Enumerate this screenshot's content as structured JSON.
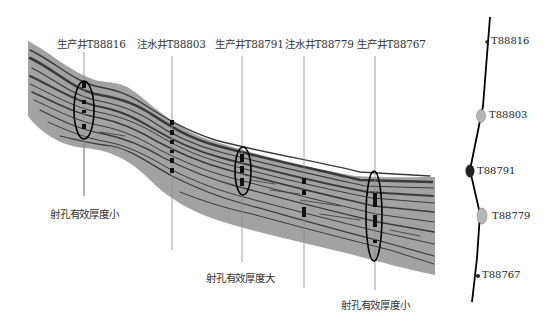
{
  "wells_top": [
    {
      "label": "生产井T88816",
      "x": 37,
      "type": "producer"
    },
    {
      "label": "注水井T88803",
      "x": 137,
      "type": "injector"
    },
    {
      "label": "生产井T88791",
      "x": 215,
      "type": "producer"
    },
    {
      "label": "注水井T88779",
      "x": 285,
      "type": "injector"
    },
    {
      "label": "生产井T88767",
      "x": 357,
      "type": "producer"
    }
  ],
  "annotations": [
    {
      "label": "射孔有效厚度小",
      "x": 50,
      "y": 206
    },
    {
      "label": "射孔有效厚度大",
      "x": 206,
      "y": 270
    },
    {
      "label": "射孔有效厚度小",
      "x": 341,
      "y": 297
    }
  ],
  "map": {
    "wells": [
      {
        "label": "T88816",
        "x": 491,
        "y": 42
      },
      {
        "label": "T88803",
        "x": 489,
        "y": 116
      },
      {
        "label": "T88791",
        "x": 478,
        "y": 172
      },
      {
        "label": "T88779",
        "x": 488,
        "y": 218
      },
      {
        "label": "T88767",
        "x": 482,
        "y": 276
      }
    ]
  },
  "colors": {
    "band": "#a2a2a2",
    "layer": "#3a3a3a",
    "well_line": "#8a8a8a",
    "ellipse": "#000000",
    "map_shaded": "#b5b5b5",
    "map_dark": "#222222"
  }
}
